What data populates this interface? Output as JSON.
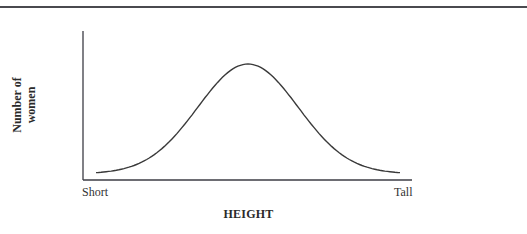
{
  "chart_data": {
    "type": "line",
    "title": "",
    "xlabel": "HEIGHT",
    "ylabel": "Number of women",
    "ylabel_lines": [
      "Number of",
      "women"
    ],
    "x_tick_labels": {
      "left": "Short",
      "right": "Tall"
    },
    "grid": false,
    "legend": null,
    "x": [
      0,
      0.1,
      0.2,
      0.3,
      0.4,
      0.5,
      0.6,
      0.7,
      0.8,
      0.9,
      1.0
    ],
    "series": [
      {
        "name": "distribution",
        "values": [
          0.02,
          0.06,
          0.17,
          0.41,
          0.76,
          1.0,
          0.76,
          0.41,
          0.17,
          0.06,
          0.02
        ]
      }
    ],
    "xlim": [
      0,
      1
    ],
    "ylim": [
      0,
      1.08
    ],
    "colors": {
      "curve": "#3a3a3a",
      "axes": "#3c3c44",
      "rule": "#4a4a4f"
    }
  }
}
